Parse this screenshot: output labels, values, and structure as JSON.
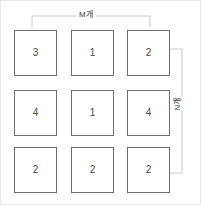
{
  "diagram": {
    "colors": {
      "cell_border": "#6f6f6f",
      "bracket_line": "#c9c9c9",
      "text": "#4a4a4a",
      "background": "#ffffff",
      "outer_border": "#e9e9e9"
    },
    "grid": {
      "rows": 3,
      "cols": 3,
      "cells": [
        [
          {
            "value": "3",
            "name": "grid-cell-r1c1"
          },
          {
            "value": "1",
            "name": "grid-cell-r1c2"
          },
          {
            "value": "2",
            "name": "grid-cell-r1c3"
          }
        ],
        [
          {
            "value": "4",
            "name": "grid-cell-r2c1"
          },
          {
            "value": "1",
            "name": "grid-cell-r2c2"
          },
          {
            "value": "4",
            "name": "grid-cell-r2c3"
          }
        ],
        [
          {
            "value": "2",
            "name": "grid-cell-r3c1"
          },
          {
            "value": "2",
            "name": "grid-cell-r3c2"
          },
          {
            "value": "2",
            "name": "grid-cell-r3c3"
          }
        ]
      ]
    },
    "annotations": {
      "top_bracket": {
        "label": "M개",
        "orientation": "horizontal",
        "spans": "columns"
      },
      "right_bracket": {
        "label": "N개",
        "orientation": "vertical",
        "spans": "rows"
      }
    }
  }
}
